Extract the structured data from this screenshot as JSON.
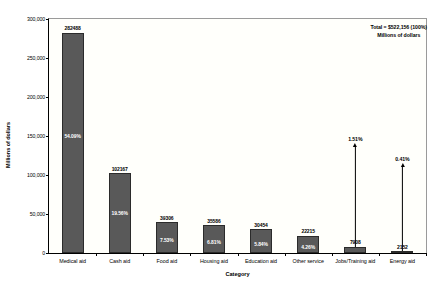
{
  "chart_data": {
    "type": "bar",
    "title": "",
    "xlabel": "Category",
    "ylabel": "Millions of dollars",
    "ylim": [
      0,
      300000
    ],
    "grid": false,
    "legend": "none",
    "categories": [
      "Medical aid",
      "Cash aid",
      "Food aid",
      "Housing aid",
      "Education aid",
      "Other service",
      "Jobs/Training aid",
      "Energy aid"
    ],
    "values": [
      282488,
      102167,
      39306,
      35586,
      30454,
      22215,
      7908,
      2152
    ],
    "value_labels": [
      "282488",
      "102167",
      "39306",
      "35586",
      "30454",
      "22215",
      "7908",
      "2152"
    ],
    "percent_labels": [
      "54.09%",
      "19.56%",
      "7.53%",
      "6.81%",
      "5.84%",
      "4.26%",
      "1.51%",
      "0.41%"
    ],
    "percent_placement": [
      "inside",
      "inside",
      "inside",
      "inside",
      "inside",
      "inside",
      "callout",
      "callout"
    ],
    "ytick_labels": [
      "300,000",
      "250,000",
      "200,000",
      "150,000",
      "100,000",
      "50,000",
      "0"
    ],
    "ytick_values": [
      300000,
      250000,
      200000,
      150000,
      100000,
      50000,
      0
    ],
    "annotations": {
      "total_line1": "Total = $522,156 (100%)",
      "total_line2": "Millions of dollars"
    },
    "colors": {
      "bar_fill": "#595959",
      "bar_edge": "#2b2b2b",
      "plot_background": "#fffffb",
      "axis": "#000000",
      "text": "#000000",
      "inside_label": "#ffffff"
    }
  }
}
